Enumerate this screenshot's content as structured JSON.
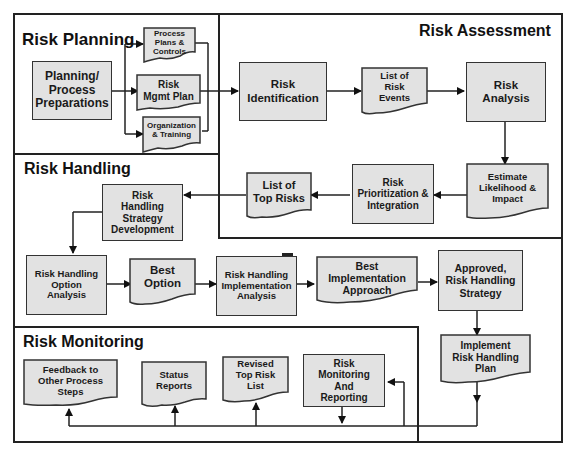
{
  "sections": {
    "planning": "Risk Planning",
    "assessment": "Risk Assessment",
    "handling": "Risk Handling",
    "monitoring": "Risk Monitoring"
  },
  "nodes": {
    "planning_prep": "Planning/\nProcess\nPreparations",
    "process_plans": "Process\nPlans &\nControls",
    "risk_mgmt_plan": "Risk\nMgmt Plan",
    "org_training": "Organization\n& Training",
    "risk_identification": "Risk\nIdentification",
    "list_risk_events": "List of\nRisk\nEvents",
    "risk_analysis": "Risk\nAnalysis",
    "estimate_likelihood": "Estimate\nLikelihood &\nImpact",
    "risk_prioritization": "Risk\nPrioritization &\nIntegration",
    "list_top_risks": "List of\nTop Risks",
    "strategy_development": "Risk\nHandling\nStrategy\nDevelopment",
    "option_analysis": "Risk Handling\nOption\nAnalysis",
    "best_option": "Best\nOption",
    "implementation_analysis": "Risk Handling\nImplementation\nAnalysis",
    "best_implementation": "Best\nImplementation\nApproach",
    "approved_strategy": "Approved,\nRisk Handling\nStrategy",
    "implement_plan": "Implement\nRisk Handling\nPlan",
    "feedback": "Feedback to\nOther Process\nSteps",
    "status_reports": "Status\nReports",
    "revised_top_risk": "Revised\nTop Risk\nList",
    "monitoring_reporting": "Risk\nMonitoring\nAnd\nReporting"
  },
  "colors": {
    "box_fill": "#e2e2e2",
    "line": "#222222"
  }
}
